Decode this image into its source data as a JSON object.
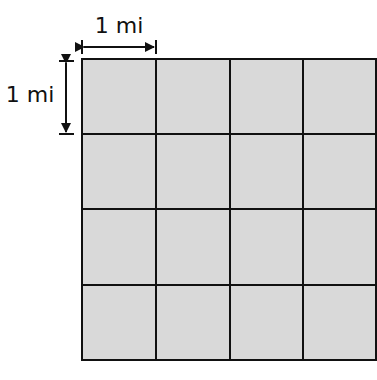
{
  "diagram": {
    "horizontal_label": "1 mi",
    "vertical_label": "1 mi",
    "grid": {
      "rows": 4,
      "cols": 4
    },
    "colors": {
      "cell_fill": "#d9d9d9",
      "line": "#111111",
      "background": "#ffffff"
    }
  }
}
